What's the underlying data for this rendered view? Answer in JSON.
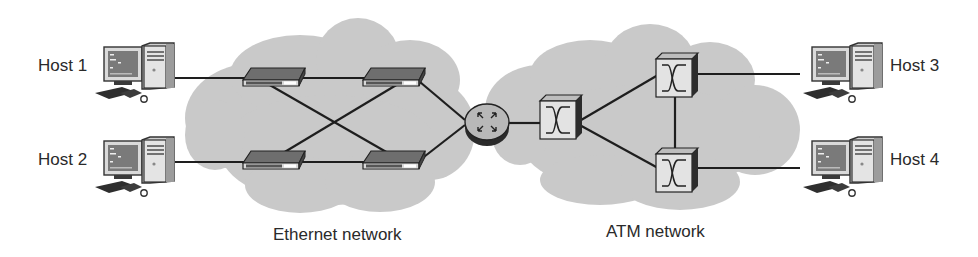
{
  "diagram": {
    "hosts": [
      {
        "id": "host1",
        "label": "Host 1"
      },
      {
        "id": "host2",
        "label": "Host 2"
      },
      {
        "id": "host3",
        "label": "Host 3"
      },
      {
        "id": "host4",
        "label": "Host 4"
      }
    ],
    "networks": [
      {
        "id": "ethernet",
        "label": "Ethernet network",
        "device_type": "ethernet-switch",
        "device_count": 4
      },
      {
        "id": "atm",
        "label": "ATM network",
        "device_type": "atm-switch",
        "device_count": 3
      }
    ],
    "router": {
      "id": "router",
      "icon": "router-icon"
    },
    "colors": {
      "cloud": "#c9c9c9",
      "cloud_edge": "#b8b8b8",
      "line": "#1e1e1e",
      "text": "#2a2a2a",
      "device_fill": "#e6e6e6",
      "device_dark": "#3a3a3a",
      "screen": "#7a7a7a"
    }
  }
}
